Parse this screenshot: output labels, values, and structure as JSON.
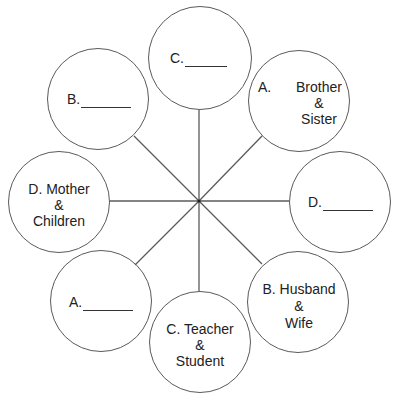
{
  "diagram": {
    "type": "relationship-wheel",
    "hub": {
      "x": 199,
      "y": 201
    },
    "line_color": "#5a5a5a",
    "nodes": [
      {
        "id": "top",
        "position": "top",
        "letter": "C.",
        "text": "",
        "blank": true,
        "cx": 200,
        "cy": 58,
        "r": 52
      },
      {
        "id": "top-right",
        "position": "top-right",
        "letter": "A.",
        "line1": "Brother",
        "line2": "&",
        "line3": "Sister",
        "blank": false,
        "cx": 299,
        "cy": 101,
        "r": 51
      },
      {
        "id": "right",
        "position": "right",
        "letter": "D.",
        "text": "",
        "blank": true,
        "cx": 340,
        "cy": 202,
        "r": 51
      },
      {
        "id": "bottom-right",
        "position": "bottom-right",
        "letter": "B.",
        "line1": "Husband",
        "line2": "&",
        "line3": "Wife",
        "blank": false,
        "cx": 298,
        "cy": 302,
        "r": 51
      },
      {
        "id": "bottom",
        "position": "bottom",
        "letter": "C.",
        "line1": "Teacher",
        "line2": "&",
        "line3": "Student",
        "blank": false,
        "cx": 200,
        "cy": 342,
        "r": 51
      },
      {
        "id": "bottom-left",
        "position": "bottom-left",
        "letter": "A.",
        "text": "",
        "blank": true,
        "cx": 100,
        "cy": 301,
        "r": 51
      },
      {
        "id": "left",
        "position": "left",
        "letter": "D.",
        "line1": "Mother",
        "line2": "&",
        "line3": "Children",
        "blank": false,
        "cx": 59,
        "cy": 202,
        "r": 51
      },
      {
        "id": "top-left",
        "position": "top-left",
        "letter": "B.",
        "text": "",
        "blank": true,
        "cx": 98,
        "cy": 99,
        "r": 51
      }
    ],
    "labels": {
      "top": "C.",
      "top_right_letter": "A.",
      "top_right_l1": "Brother",
      "top_right_l2": "&",
      "top_right_l3": "Sister",
      "right": "D.",
      "bottom_right_l1": "B. Husband",
      "bottom_right_l2": "&",
      "bottom_right_l3": "Wife",
      "bottom_l1": "C. Teacher",
      "bottom_l2": "&",
      "bottom_l3": "Student",
      "bottom_left": "A.",
      "left_l1": "D. Mother",
      "left_l2": "&",
      "left_l3": "Children",
      "top_left": "B."
    }
  }
}
